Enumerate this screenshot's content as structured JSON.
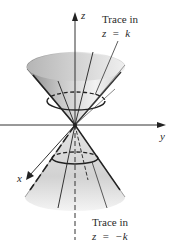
{
  "figure": {
    "axes": {
      "z_label": "z",
      "y_label": "y",
      "x_label": "x"
    },
    "annotations": {
      "top": {
        "line1": "Trace in",
        "line2": "z = k"
      },
      "bottom": {
        "line1": "Trace in",
        "line2": "z = −k"
      }
    }
  }
}
